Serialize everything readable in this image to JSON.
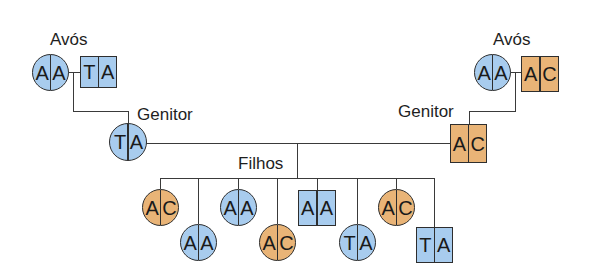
{
  "diagram": {
    "type": "pedigree",
    "colors": {
      "blue": "#a8ccee",
      "orange": "#e9b477",
      "outline": "#2e2e2e",
      "line": "#3a3a3a"
    },
    "labels": {
      "grandparents_left": "Avós",
      "grandparents_right": "Avós",
      "parent_left": "Genitor",
      "parent_right": "Genitor",
      "children": "Filhos"
    },
    "grandparents_left": {
      "female": {
        "shape": "circle",
        "color": "blue",
        "alleles": [
          "A",
          "A"
        ]
      },
      "male": {
        "shape": "square",
        "color": "blue",
        "alleles": [
          "T",
          "A"
        ]
      }
    },
    "grandparents_right": {
      "female": {
        "shape": "circle",
        "color": "blue",
        "alleles": [
          "A",
          "A"
        ]
      },
      "male": {
        "shape": "square",
        "color": "orange",
        "alleles": [
          "A",
          "C"
        ]
      }
    },
    "parent_left": {
      "shape": "circle",
      "color": "blue",
      "alleles": [
        "T",
        "A"
      ]
    },
    "parent_right": {
      "shape": "square",
      "color": "orange",
      "alleles": [
        "A",
        "C"
      ]
    },
    "children": [
      {
        "shape": "circle",
        "color": "orange",
        "alleles": [
          "A",
          "C"
        ]
      },
      {
        "shape": "circle",
        "color": "blue",
        "alleles": [
          "A",
          "A"
        ]
      },
      {
        "shape": "circle",
        "color": "blue",
        "alleles": [
          "A",
          "A"
        ]
      },
      {
        "shape": "circle",
        "color": "orange",
        "alleles": [
          "A",
          "C"
        ]
      },
      {
        "shape": "square",
        "color": "blue",
        "alleles": [
          "A",
          "A"
        ]
      },
      {
        "shape": "circle",
        "color": "blue",
        "alleles": [
          "T",
          "A"
        ]
      },
      {
        "shape": "circle",
        "color": "orange",
        "alleles": [
          "A",
          "C"
        ]
      },
      {
        "shape": "square",
        "color": "blue",
        "alleles": [
          "T",
          "A"
        ]
      }
    ]
  }
}
